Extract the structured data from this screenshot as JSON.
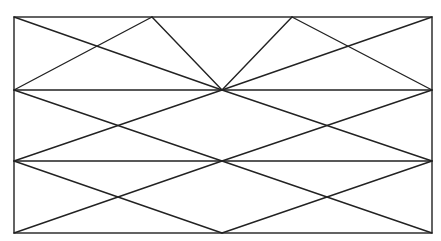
{
  "diagram": {
    "title": "",
    "canvas": {
      "width": 441,
      "height": 241,
      "background": "#ffffff"
    },
    "style": {
      "stroke": "#222222",
      "stroke_width": 1.4
    },
    "frame": {
      "x1": 14,
      "y1": 17,
      "x2": 432,
      "y2": 233
    },
    "nodes": [
      {
        "id": "TL",
        "x": 14,
        "y": 17
      },
      {
        "id": "A1",
        "x": 152,
        "y": 17
      },
      {
        "id": "A2",
        "x": 292,
        "y": 17
      },
      {
        "id": "TR",
        "x": 432,
        "y": 17
      },
      {
        "id": "ML1",
        "x": 14,
        "y": 90
      },
      {
        "id": "C1",
        "x": 222,
        "y": 90
      },
      {
        "id": "MR1",
        "x": 432,
        "y": 90
      },
      {
        "id": "ML2",
        "x": 14,
        "y": 161
      },
      {
        "id": "C2",
        "x": 222,
        "y": 161
      },
      {
        "id": "MR2",
        "x": 432,
        "y": 161
      },
      {
        "id": "BL",
        "x": 14,
        "y": 233
      },
      {
        "id": "B1",
        "x": 222,
        "y": 233
      },
      {
        "id": "BR",
        "x": 432,
        "y": 233
      }
    ],
    "lines": [
      {
        "name": "horizontal-line-upper",
        "x1": 14,
        "y1": 90,
        "x2": 432,
        "y2": 90
      },
      {
        "name": "horizontal-line-lower",
        "x1": 14,
        "y1": 161,
        "x2": 432,
        "y2": 161
      },
      {
        "name": "top-diagonal-tl-center",
        "x1": 14,
        "y1": 17,
        "x2": 222,
        "y2": 90
      },
      {
        "name": "top-diagonal-ml-apex1",
        "x1": 14,
        "y1": 90,
        "x2": 152,
        "y2": 17
      },
      {
        "name": "top-diagonal-apex1-center",
        "x1": 152,
        "y1": 17,
        "x2": 222,
        "y2": 90
      },
      {
        "name": "top-diagonal-center-apex2",
        "x1": 222,
        "y1": 90,
        "x2": 292,
        "y2": 17
      },
      {
        "name": "top-diagonal-apex2-mr",
        "x1": 292,
        "y1": 17,
        "x2": 432,
        "y2": 90
      },
      {
        "name": "top-diagonal-center-tr",
        "x1": 222,
        "y1": 90,
        "x2": 432,
        "y2": 17
      },
      {
        "name": "middle-diagonal-left-down",
        "x1": 14,
        "y1": 90,
        "x2": 222,
        "y2": 161
      },
      {
        "name": "middle-diagonal-left-up",
        "x1": 222,
        "y1": 90,
        "x2": 14,
        "y2": 161
      },
      {
        "name": "middle-diagonal-right-down",
        "x1": 222,
        "y1": 90,
        "x2": 432,
        "y2": 161
      },
      {
        "name": "middle-diagonal-right-up",
        "x1": 432,
        "y1": 90,
        "x2": 222,
        "y2": 161
      },
      {
        "name": "bottom-diagonal-left-down",
        "x1": 14,
        "y1": 161,
        "x2": 222,
        "y2": 233
      },
      {
        "name": "bottom-diagonal-left-up",
        "x1": 222,
        "y1": 161,
        "x2": 14,
        "y2": 233
      },
      {
        "name": "bottom-diagonal-right-down",
        "x1": 222,
        "y1": 161,
        "x2": 432,
        "y2": 233
      },
      {
        "name": "bottom-diagonal-right-up",
        "x1": 432,
        "y1": 161,
        "x2": 222,
        "y2": 233
      }
    ]
  }
}
